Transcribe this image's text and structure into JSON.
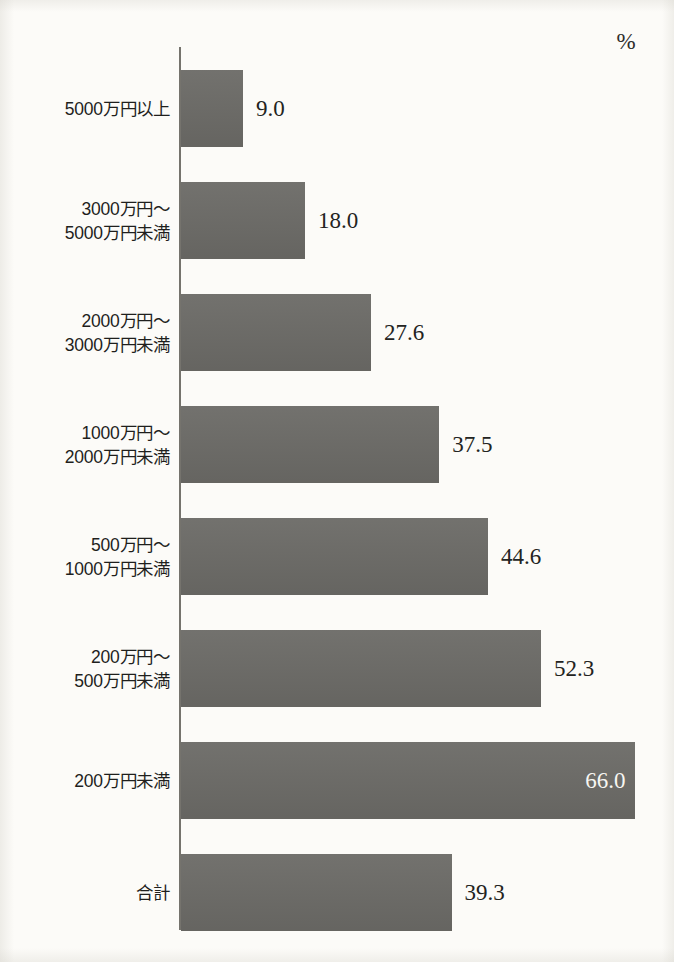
{
  "chart_data": {
    "type": "bar",
    "orientation": "horizontal",
    "title": "",
    "subtitle": "",
    "xlabel": "",
    "ylabel": "",
    "unit_label": "%",
    "unit_position": "top-right",
    "grid": false,
    "legend": false,
    "axis_line": "vertical-left",
    "xlim": [
      0,
      66
    ],
    "value_format": "one-decimal",
    "categories": [
      "5000万円以上",
      "3000万円～\n5000万円未満",
      "2000万円～\n3000万円未満",
      "1000万円～\n2000万円未満",
      "500万円～\n1000万円未満",
      "200万円～\n500万円未満",
      "200万円未満",
      "合計"
    ],
    "values": [
      9.0,
      18.0,
      27.6,
      37.5,
      44.6,
      52.3,
      66.0,
      39.3
    ],
    "value_text": [
      "9.0",
      "18.0",
      "27.6",
      "37.5",
      "44.6",
      "52.3",
      "66.0",
      "39.3"
    ],
    "label_placement": [
      "outside",
      "outside",
      "outside",
      "outside",
      "outside",
      "outside",
      "inside",
      "outside"
    ],
    "bar_color": "#6b6a66",
    "background_color": "#fcfbf8",
    "text_color": "#232321",
    "inside_text_color": "#f7f6f2",
    "axis_color": "#75736d"
  },
  "geometry": {
    "axis_x": 181,
    "px_per_unit": 6.885,
    "bar_height": 77,
    "row_pitch": 112,
    "first_bar_top": 70,
    "value_gap": 13
  }
}
